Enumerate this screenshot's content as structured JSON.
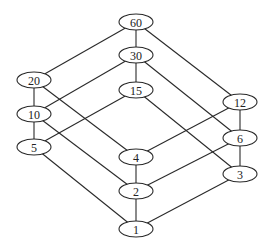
{
  "diagram": {
    "type": "hasse-diagram",
    "nodes": [
      {
        "id": "60",
        "label": "60",
        "x": 136,
        "y": 22
      },
      {
        "id": "30",
        "label": "30",
        "x": 136,
        "y": 55
      },
      {
        "id": "15",
        "label": "15",
        "x": 136,
        "y": 90
      },
      {
        "id": "20",
        "label": "20",
        "x": 34,
        "y": 80
      },
      {
        "id": "10",
        "label": "10",
        "x": 34,
        "y": 114
      },
      {
        "id": "5",
        "label": "5",
        "x": 34,
        "y": 147
      },
      {
        "id": "12",
        "label": "12",
        "x": 240,
        "y": 102
      },
      {
        "id": "6",
        "label": "6",
        "x": 240,
        "y": 138
      },
      {
        "id": "3",
        "label": "3",
        "x": 240,
        "y": 174
      },
      {
        "id": "4",
        "label": "4",
        "x": 136,
        "y": 157
      },
      {
        "id": "2",
        "label": "2",
        "x": 136,
        "y": 191
      },
      {
        "id": "1",
        "label": "1",
        "x": 136,
        "y": 229
      }
    ],
    "edges": [
      [
        "60",
        "30"
      ],
      [
        "60",
        "20"
      ],
      [
        "60",
        "12"
      ],
      [
        "30",
        "15"
      ],
      [
        "30",
        "10"
      ],
      [
        "30",
        "6"
      ],
      [
        "20",
        "10"
      ],
      [
        "20",
        "4"
      ],
      [
        "15",
        "5"
      ],
      [
        "15",
        "3"
      ],
      [
        "12",
        "6"
      ],
      [
        "12",
        "4"
      ],
      [
        "10",
        "5"
      ],
      [
        "10",
        "2"
      ],
      [
        "6",
        "3"
      ],
      [
        "6",
        "2"
      ],
      [
        "4",
        "2"
      ],
      [
        "5",
        "1"
      ],
      [
        "2",
        "1"
      ],
      [
        "3",
        "1"
      ]
    ],
    "node_rx": 17,
    "node_ry": 8
  }
}
